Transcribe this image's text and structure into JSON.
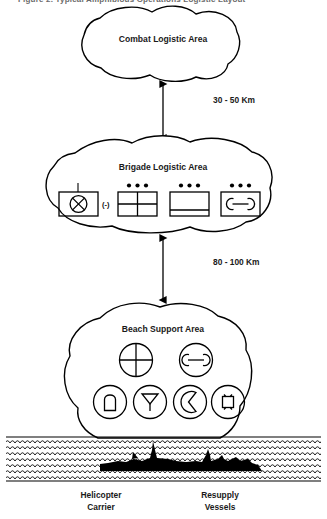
{
  "diagram": {
    "title_partial": "Figure 2. Typical Amphibious Operations Logistic Layout",
    "areas": [
      {
        "id": "combat-logistic-area",
        "label": "Combat Logistic Area"
      },
      {
        "id": "brigade-logistic-area",
        "label": "Brigade Logistic Area"
      },
      {
        "id": "beach-support-area",
        "label": "Beach Support Area"
      }
    ],
    "distances": [
      {
        "id": "distance-upper",
        "label": "30 - 50 Km"
      },
      {
        "id": "distance-lower",
        "label": "80 - 100 Km"
      }
    ],
    "brigade_symbols": [
      {
        "id": "supply-point-symbol",
        "icon": "circle-x-supply-icon",
        "size_modifier": "(-)",
        "echelon_dots": 0,
        "echelon_tick": true
      },
      {
        "id": "quartered-unit-symbol",
        "icon": "quartered-rectangle-icon",
        "size_modifier": "",
        "echelon_dots": 3,
        "echelon_tick": false
      },
      {
        "id": "banded-unit-symbol",
        "icon": "banded-rectangle-icon",
        "size_modifier": "",
        "echelon_dots": 3,
        "echelon_tick": false
      },
      {
        "id": "maintenance-unit-symbol",
        "icon": "maintenance-wrench-icon",
        "size_modifier": "",
        "echelon_dots": 3,
        "echelon_tick": false
      }
    ],
    "beach_symbols": [
      {
        "id": "beach-symbol-crosshair",
        "icon": "crosshair-circle-icon",
        "row": 1
      },
      {
        "id": "beach-symbol-maintenance",
        "icon": "maintenance-wrench-circle-icon",
        "row": 1
      },
      {
        "id": "beach-symbol-ammunition",
        "icon": "ammunition-round-circle-icon",
        "row": 2
      },
      {
        "id": "beach-symbol-petroleum",
        "icon": "funnel-pol-circle-icon",
        "row": 2
      },
      {
        "id": "beach-symbol-rations",
        "icon": "crescent-rations-circle-icon",
        "row": 2
      },
      {
        "id": "beach-symbol-general-supply",
        "icon": "square-general-supply-circle-icon",
        "row": 2
      }
    ],
    "ships": [
      {
        "id": "helicopter-carrier",
        "label_line1": "Helicopter",
        "label_line2": "Carrier"
      },
      {
        "id": "resupply-vessels",
        "label_line1": "Resupply",
        "label_line2": "Vessels"
      }
    ],
    "colors": {
      "line": "#000000",
      "background": "#ffffff",
      "text": "#1a1a1a",
      "sea_fill": "#000000"
    }
  }
}
